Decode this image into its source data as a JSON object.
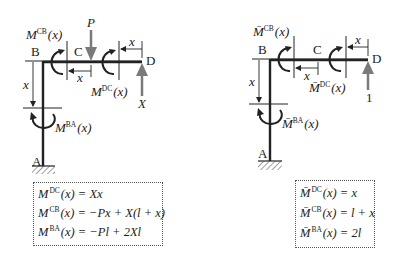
{
  "left_diagram": {
    "title": "Actual load system",
    "nodes": {
      "A": "A",
      "B": "B",
      "C": "C",
      "D": "D"
    },
    "load_label": "P",
    "reaction_label": "X",
    "dim_label": "x",
    "moment_labels": {
      "CB": {
        "M": "M",
        "sup": "CB",
        "arg": "(x)"
      },
      "DC": {
        "M": "M",
        "sup": "DC",
        "arg": "(x)"
      },
      "BA": {
        "M": "M",
        "sup": "BA",
        "arg": "(x)"
      }
    },
    "equations": [
      {
        "M": "M",
        "sup": "DC",
        "rhs": "(x) = Xx"
      },
      {
        "M": "M",
        "sup": "CB",
        "rhs": "(x) = −Px + X(l + x)"
      },
      {
        "M": "M",
        "sup": "BA",
        "rhs": "(x) = −Pl + 2Xl"
      }
    ]
  },
  "right_diagram": {
    "title": "Unit load system",
    "nodes": {
      "A": "A",
      "B": "B",
      "C": "C",
      "D": "D"
    },
    "reaction_label": "1",
    "dim_label": "x",
    "moment_labels": {
      "CB": {
        "M": "M̄",
        "sup": "CB",
        "arg": "(x)"
      },
      "DC": {
        "M": "M̄",
        "sup": "DC",
        "arg": "(x)"
      },
      "BA": {
        "M": "M̄",
        "sup": "BA",
        "arg": "(x)"
      }
    },
    "equations": [
      {
        "M": "M̄",
        "sup": "DC",
        "rhs": "(x) = x"
      },
      {
        "M": "M̄",
        "sup": "CB",
        "rhs": "(x) = l + x"
      },
      {
        "M": "M̄",
        "sup": "BA",
        "rhs": "(x) = 2l"
      }
    ]
  },
  "colors": {
    "line": "#222222",
    "arrow_gray": "#7a7a7a",
    "text": "#222222"
  }
}
